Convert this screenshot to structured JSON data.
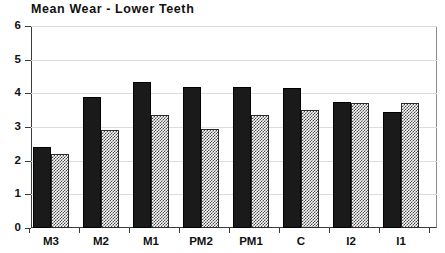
{
  "chart_data": {
    "type": "bar",
    "title": "Mean Wear - Lower Teeth",
    "xlabel": "",
    "ylabel": "",
    "ylim": [
      0,
      6
    ],
    "yticks": [
      0,
      1,
      2,
      3,
      4,
      5,
      6
    ],
    "ytick_labels": [
      "0",
      "1",
      "2",
      "3",
      "4",
      "5",
      "6"
    ],
    "grid": true,
    "grid_axis": "y",
    "legend": null,
    "legend_position": "none",
    "categories": [
      "M3",
      "M2",
      "M1",
      "PM2",
      "PM1",
      "C",
      "I2",
      "I1"
    ],
    "series": [
      {
        "name": "series-1",
        "fill": "solid-black",
        "color": "#1a1a1a",
        "values": [
          2.4,
          3.9,
          4.35,
          4.2,
          4.2,
          4.15,
          3.75,
          3.45
        ]
      },
      {
        "name": "series-2",
        "fill": "hatched-gray",
        "color": "#4a4a4a",
        "values": [
          2.2,
          2.9,
          3.35,
          2.95,
          3.35,
          3.5,
          3.7,
          3.7
        ]
      }
    ]
  },
  "axes": {
    "axis_color": "#3a3a3a",
    "grid_color": "#dcdcdc"
  }
}
